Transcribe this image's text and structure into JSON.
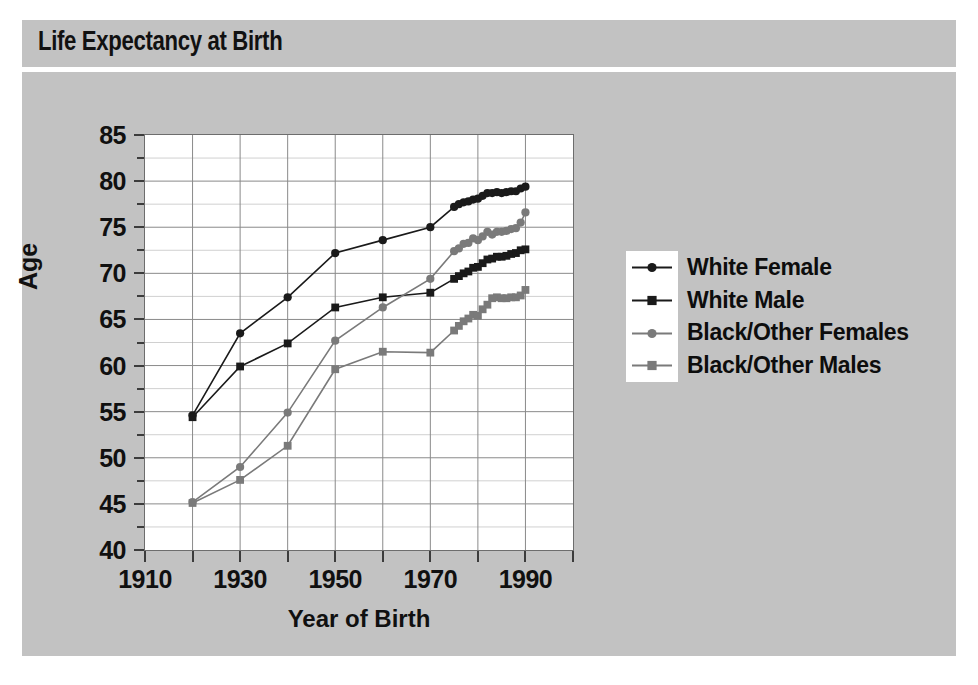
{
  "header": {
    "title": "Life Expectancy at Birth"
  },
  "colors": {
    "panel_background": "#c2c2c2",
    "plot_background": "#ffffff",
    "frame": "#6d6d6d",
    "grid_major": "#8a8a8a",
    "grid_minor": "#d0d0d0",
    "series_dark": "#1a1a1a",
    "series_gray": "#7a7a7a",
    "text": "#101010"
  },
  "caption": "",
  "chart_data": {
    "type": "line",
    "title": "Life Expectancy at Birth",
    "xlabel": "Year of Birth",
    "ylabel": "Age",
    "xlim": [
      1910,
      2000
    ],
    "ylim": [
      40,
      85
    ],
    "xticks": [
      1910,
      1920,
      1930,
      1940,
      1950,
      1960,
      1970,
      1980,
      1990,
      2000
    ],
    "xtick_labels": [
      "1910",
      "",
      "1930",
      "",
      "1950",
      "",
      "1970",
      "",
      "1990",
      ""
    ],
    "yticks": [
      40,
      45,
      50,
      55,
      60,
      65,
      70,
      75,
      80,
      85
    ],
    "ytick_labels": [
      "40",
      "45",
      "50",
      "55",
      "60",
      "65",
      "70",
      "75",
      "80",
      "85"
    ],
    "yticks_minor": [
      42.5,
      47.5,
      52.5,
      57.5,
      62.5,
      67.5,
      72.5,
      77.5,
      82.5
    ],
    "grid": true,
    "legend_position": "right",
    "series": [
      {
        "name": "White Female",
        "color": "#1a1a1a",
        "marker": "circle",
        "x": [
          1920,
          1930,
          1940,
          1950,
          1960,
          1970,
          1975,
          1976,
          1977,
          1978,
          1979,
          1980,
          1981,
          1982,
          1983,
          1984,
          1985,
          1986,
          1987,
          1988,
          1989,
          1990
        ],
        "y": [
          54.6,
          63.5,
          67.4,
          72.2,
          73.6,
          75.0,
          77.2,
          77.5,
          77.7,
          77.8,
          78.0,
          78.1,
          78.4,
          78.7,
          78.7,
          78.8,
          78.7,
          78.8,
          78.9,
          78.9,
          79.2,
          79.4
        ]
      },
      {
        "name": "White Male",
        "color": "#1a1a1a",
        "marker": "square",
        "x": [
          1920,
          1930,
          1940,
          1950,
          1960,
          1970,
          1975,
          1976,
          1977,
          1978,
          1979,
          1980,
          1981,
          1982,
          1983,
          1984,
          1985,
          1986,
          1987,
          1988,
          1989,
          1990
        ],
        "y": [
          54.4,
          59.9,
          62.4,
          66.3,
          67.4,
          67.9,
          69.4,
          69.7,
          70.0,
          70.2,
          70.6,
          70.7,
          71.1,
          71.5,
          71.6,
          71.8,
          71.8,
          71.9,
          72.1,
          72.2,
          72.5,
          72.6
        ]
      },
      {
        "name": "Black/Other Females",
        "color": "#7a7a7a",
        "marker": "circle",
        "x": [
          1920,
          1930,
          1940,
          1950,
          1960,
          1970,
          1975,
          1976,
          1977,
          1978,
          1979,
          1980,
          1981,
          1982,
          1983,
          1984,
          1985,
          1986,
          1987,
          1988,
          1989,
          1990
        ],
        "y": [
          45.2,
          49.0,
          54.9,
          62.7,
          66.3,
          69.4,
          72.4,
          72.7,
          73.2,
          73.3,
          73.8,
          73.6,
          74.0,
          74.5,
          74.2,
          74.5,
          74.5,
          74.6,
          74.8,
          74.9,
          75.5,
          76.6
        ]
      },
      {
        "name": "Black/Other Males",
        "color": "#7a7a7a",
        "marker": "square",
        "x": [
          1920,
          1930,
          1940,
          1950,
          1960,
          1970,
          1975,
          1976,
          1977,
          1978,
          1979,
          1980,
          1981,
          1982,
          1983,
          1984,
          1985,
          1986,
          1987,
          1988,
          1989,
          1990
        ],
        "y": [
          45.1,
          47.6,
          51.3,
          59.6,
          61.5,
          61.4,
          63.8,
          64.3,
          64.8,
          65.1,
          65.5,
          65.4,
          66.1,
          66.6,
          67.3,
          67.4,
          67.3,
          67.3,
          67.4,
          67.4,
          67.6,
          68.2
        ]
      }
    ]
  },
  "legend": {
    "items": [
      {
        "label": "White Female"
      },
      {
        "label": "White Male"
      },
      {
        "label": "Black/Other Females"
      },
      {
        "label": "Black/Other Males"
      }
    ]
  }
}
